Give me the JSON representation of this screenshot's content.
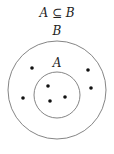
{
  "title": "A ⊆ B",
  "sets": [
    {
      "label": "B",
      "role": "outer",
      "cx": 57,
      "cy": 90,
      "r": 49
    },
    {
      "label": "A",
      "role": "inner",
      "cx": 57,
      "cy": 95,
      "r": 23
    }
  ],
  "points": {
    "in_A": [
      [
        48,
        86
      ],
      [
        50,
        101
      ],
      [
        65,
        97
      ]
    ],
    "in_B_only": [
      [
        32,
        68
      ],
      [
        88,
        70
      ],
      [
        23,
        98
      ],
      [
        91,
        88
      ]
    ]
  },
  "colors": {
    "stroke": "#777777",
    "dot": "#111111",
    "text": "#222222"
  }
}
